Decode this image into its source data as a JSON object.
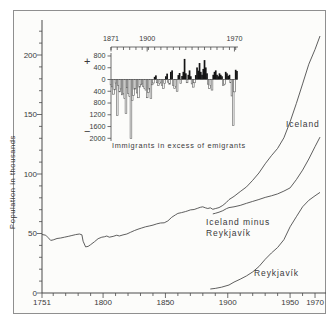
{
  "colors": {
    "line": "#4d4d4d",
    "axis": "#4a4a4a",
    "bar_fill": "#141414",
    "bar_outline": "#5a5a5a",
    "background": "#fcfcfa",
    "frame": "#8f8f8f",
    "text": "#3a3a3a"
  },
  "chart_data": [
    {
      "type": "line",
      "title": "Population of Iceland, Reykjavík and Iceland minus Reykjavík",
      "xlabel": "",
      "ylabel": "Population in thousands",
      "xlim": [
        1751,
        1978
      ],
      "ylim": [
        0,
        230
      ],
      "grid": false,
      "legend_position": "inline-labels",
      "x_major_ticks": [
        1751,
        1800,
        1850,
        1900,
        1950,
        1970
      ],
      "x_minor_step": 10,
      "y_major_ticks": [
        0,
        50,
        100,
        150,
        200
      ],
      "y_minor_step": 10,
      "series": [
        {
          "id": "iceland",
          "name": "Iceland",
          "points": [
            [
              1751,
              49.2
            ],
            [
              1754,
              48.6
            ],
            [
              1756,
              46.5
            ],
            [
              1758,
              44.2
            ],
            [
              1760,
              44.6
            ],
            [
              1763,
              45.8
            ],
            [
              1766,
              46.2
            ],
            [
              1769,
              46.9
            ],
            [
              1772,
              47.6
            ],
            [
              1775,
              48.3
            ],
            [
              1778,
              49.1
            ],
            [
              1781,
              49.6
            ],
            [
              1783,
              48.9
            ],
            [
              1784,
              43.5
            ],
            [
              1786,
              38.7
            ],
            [
              1788,
              39.2
            ],
            [
              1790,
              40.6
            ],
            [
              1793,
              43.0
            ],
            [
              1796,
              45.6
            ],
            [
              1799,
              46.9
            ],
            [
              1801,
              47.2
            ],
            [
              1803,
              47.9
            ],
            [
              1805,
              46.9
            ],
            [
              1808,
              47.6
            ],
            [
              1811,
              48.6
            ],
            [
              1813,
              47.9
            ],
            [
              1816,
              48.8
            ],
            [
              1819,
              49.6
            ],
            [
              1822,
              51.0
            ],
            [
              1825,
              52.4
            ],
            [
              1828,
              53.6
            ],
            [
              1831,
              54.6
            ],
            [
              1834,
              55.6
            ],
            [
              1837,
              56.3
            ],
            [
              1840,
              57.1
            ],
            [
              1843,
              58.1
            ],
            [
              1846,
              58.8
            ],
            [
              1849,
              59.0
            ],
            [
              1852,
              60.6
            ],
            [
              1855,
              63.6
            ],
            [
              1858,
              65.6
            ],
            [
              1860,
              66.9
            ],
            [
              1863,
              67.6
            ],
            [
              1866,
              68.4
            ],
            [
              1868,
              69.1
            ],
            [
              1870,
              69.8
            ],
            [
              1873,
              70.2
            ],
            [
              1876,
              71.3
            ],
            [
              1878,
              72.0
            ],
            [
              1880,
              72.4
            ],
            [
              1882,
              71.6
            ],
            [
              1884,
              71.0
            ],
            [
              1886,
              71.6
            ],
            [
              1888,
              70.3
            ],
            [
              1890,
              70.9
            ],
            [
              1893,
              71.8
            ],
            [
              1896,
              73.6
            ],
            [
              1899,
              76.2
            ],
            [
              1901,
              78.5
            ],
            [
              1905,
              81.2
            ],
            [
              1910,
              85.2
            ],
            [
              1915,
              89.2
            ],
            [
              1920,
              94.7
            ],
            [
              1925,
              100.8
            ],
            [
              1930,
              108.6
            ],
            [
              1935,
              115.4
            ],
            [
              1940,
              121.5
            ],
            [
              1945,
              130.4
            ],
            [
              1950,
              143.9
            ],
            [
              1955,
              159.2
            ],
            [
              1960,
              175.7
            ],
            [
              1965,
              192.3
            ],
            [
              1970,
              204.6
            ],
            [
              1974,
              216.0
            ]
          ]
        },
        {
          "id": "iceland-minus-reykjavik",
          "name": "Iceland minus Reykjavík",
          "label_lines": [
            "Iceland minus",
            "Reykjavík"
          ],
          "points": [
            [
              1888,
              66.5
            ],
            [
              1890,
              67.0
            ],
            [
              1893,
              67.9
            ],
            [
              1896,
              69.2
            ],
            [
              1899,
              70.9
            ],
            [
              1901,
              71.8
            ],
            [
              1905,
              72.4
            ],
            [
              1910,
              73.6
            ],
            [
              1915,
              75.4
            ],
            [
              1920,
              77.0
            ],
            [
              1925,
              78.6
            ],
            [
              1930,
              80.3
            ],
            [
              1935,
              81.7
            ],
            [
              1940,
              83.3
            ],
            [
              1945,
              85.6
            ],
            [
              1950,
              88.3
            ],
            [
              1955,
              95.2
            ],
            [
              1960,
              103.3
            ],
            [
              1965,
              112.6
            ],
            [
              1970,
              122.9
            ],
            [
              1974,
              131.0
            ]
          ]
        },
        {
          "id": "reykjavik",
          "name": "Reykjavík",
          "points": [
            [
              1886,
              3.4
            ],
            [
              1890,
              3.9
            ],
            [
              1895,
              4.9
            ],
            [
              1901,
              6.7
            ],
            [
              1905,
              9.2
            ],
            [
              1910,
              11.6
            ],
            [
              1915,
              14.4
            ],
            [
              1920,
              17.7
            ],
            [
              1925,
              22.2
            ],
            [
              1930,
              28.3
            ],
            [
              1935,
              33.6
            ],
            [
              1940,
              38.2
            ],
            [
              1945,
              44.8
            ],
            [
              1950,
              55.6
            ],
            [
              1955,
              64.0
            ],
            [
              1960,
              72.4
            ],
            [
              1965,
              77.9
            ],
            [
              1970,
              81.7
            ],
            [
              1974,
              84.5
            ]
          ]
        }
      ]
    },
    {
      "type": "bar",
      "title": "Immigrants in excess of emigrants",
      "plus_sign": "+",
      "minus_sign": "−",
      "xlim": [
        1871,
        1973
      ],
      "ylim": [
        -2000,
        800
      ],
      "x_labeled_ticks": [
        1871,
        1900,
        1970
      ],
      "x_minor_step": 5,
      "y_ticks": [
        800,
        400,
        0,
        -400,
        -800,
        -1200,
        -1600,
        -2000
      ],
      "y_tick_labels": [
        "800",
        "400",
        "0",
        "400",
        "800",
        "1200",
        "1600",
        "2000"
      ],
      "x_start": 1871,
      "values": [
        -180,
        -250,
        -500,
        -350,
        -120,
        -1230,
        -200,
        -420,
        -320,
        -520,
        -480,
        -650,
        -1150,
        -280,
        -470,
        -580,
        -2000,
        -720,
        -540,
        -330,
        -300,
        -460,
        -620,
        -260,
        -180,
        -140,
        -240,
        -310,
        -360,
        -620,
        -440,
        -330,
        -650,
        -180,
        -120,
        90,
        140,
        -110,
        -200,
        -140,
        -90,
        -210,
        -300,
        -140,
        110,
        200,
        -90,
        -160,
        260,
        310,
        -200,
        -310,
        -240,
        -400,
        150,
        220,
        -140,
        120,
        260,
        700,
        210,
        -110,
        160,
        310,
        110,
        -150,
        -260,
        -110,
        150,
        410,
        300,
        560,
        260,
        160,
        360,
        660,
        410,
        210,
        -160,
        -310,
        -210,
        -360,
        160,
        260,
        310,
        160,
        110,
        210,
        160,
        110,
        -210,
        -160,
        260,
        210,
        120,
        160,
        -110,
        -560,
        -1560,
        -420,
        330,
        290
      ]
    }
  ]
}
